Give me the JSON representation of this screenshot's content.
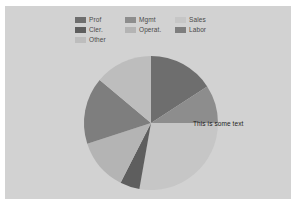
{
  "page": {
    "background_color": "#ffffff",
    "panel_color": "#d4d4d4"
  },
  "legend": {
    "position": "top",
    "columns": 3,
    "entries": [
      {
        "label": "Prof",
        "color": "#6e6e6e",
        "icon": "legend-swatch-icon"
      },
      {
        "label": "Mgmt",
        "color": "#8d8d8d",
        "icon": "legend-swatch-icon"
      },
      {
        "label": "Sales",
        "color": "#c6c6c6",
        "icon": "legend-swatch-icon"
      },
      {
        "label": "Cler.",
        "color": "#5e5e5e",
        "icon": "legend-swatch-icon"
      },
      {
        "label": "Operat.",
        "color": "#b4b4b4",
        "icon": "legend-swatch-icon"
      },
      {
        "label": "Labor",
        "color": "#7e7e7e",
        "icon": "legend-swatch-icon"
      },
      {
        "label": "Other",
        "color": "#bdbdbd",
        "icon": "legend-swatch-icon"
      }
    ]
  },
  "annotation": {
    "text": "This is some text",
    "color": "#1c1c1c"
  },
  "chart_data": {
    "type": "pie",
    "title": "",
    "subtitle": "",
    "xlabel": "",
    "ylabel": "",
    "grid": false,
    "legend_position": "top",
    "start_angle_deg": 90,
    "direction": "clockwise",
    "center_px": [
      146,
      117
    ],
    "radius_px": 67,
    "labels": [
      "Prof",
      "Mgmt",
      "Sales",
      "Cler.",
      "Operat.",
      "Labor",
      "Other"
    ],
    "colors": [
      "#6e6e6e",
      "#8d8d8d",
      "#c6c6c6",
      "#5e5e5e",
      "#b4b4b4",
      "#7e7e7e",
      "#bdbdbd"
    ],
    "angles_deg": [
      57,
      33,
      100,
      17,
      45,
      58,
      50
    ],
    "values": [
      15.8,
      9.2,
      27.8,
      4.7,
      12.5,
      16.1,
      13.9
    ],
    "annotations": [
      {
        "text": "This is some text",
        "slice": "Sales",
        "x_px": 188,
        "y_px": 120
      }
    ]
  }
}
